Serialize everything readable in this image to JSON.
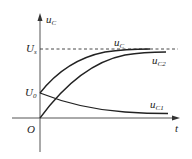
{
  "diagram": {
    "type": "capacitor-voltage-curves",
    "axes": {
      "y_label": {
        "main": "u",
        "sub": "C"
      },
      "x_label": "t",
      "origin_label": "O"
    },
    "levels": {
      "us": {
        "main": "U",
        "sub": "s"
      },
      "u0": {
        "main": "U",
        "sub": "0"
      }
    },
    "curves": [
      {
        "id": "uc",
        "label_main": "u",
        "label_sub": "C",
        "description": "rises from U0 to Us"
      },
      {
        "id": "uc2",
        "label_main": "u",
        "label_sub": "C2",
        "description": "rises from 0 to Us"
      },
      {
        "id": "uc1",
        "label_main": "u",
        "label_sub": "C1",
        "description": "decays from U0 to 0"
      }
    ],
    "colors": {
      "line": "#222222",
      "axis": "#555555",
      "dash": "#333333"
    }
  }
}
